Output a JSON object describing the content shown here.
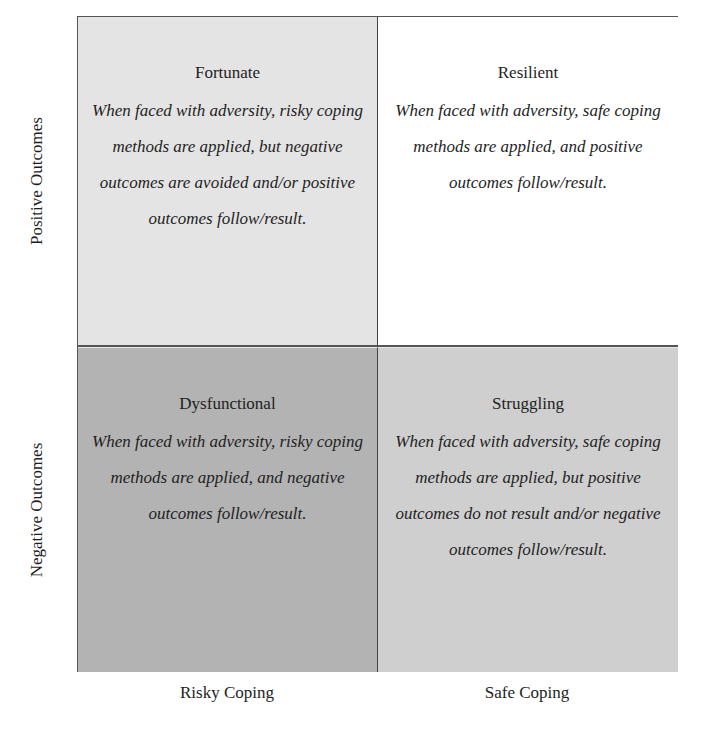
{
  "axes": {
    "y_labels": [
      "Positive Outcomes",
      "Negative Outcomes"
    ],
    "x_labels": [
      "Risky Coping",
      "Safe Coping"
    ]
  },
  "quadrants": {
    "top_left": {
      "title": "Fortunate",
      "description": "When faced with adversity, risky coping methods are applied, but negative outcomes are avoided and/or positive outcomes follow/result.",
      "fill": "#e4e4e4"
    },
    "top_right": {
      "title": "Resilient",
      "description": "When faced with adversity, safe coping methods are applied, and positive outcomes follow/result.",
      "fill": "#ffffff"
    },
    "bottom_left": {
      "title": "Dysfunctional",
      "description": "When faced with adversity, risky coping methods are applied, and negative outcomes follow/result.",
      "fill": "#b3b3b3"
    },
    "bottom_right": {
      "title": "Struggling",
      "description": "When faced with adversity, safe coping methods are applied, but positive outcomes do not result and/or negative outcomes follow/result.",
      "fill": "#cfcfcf"
    }
  }
}
